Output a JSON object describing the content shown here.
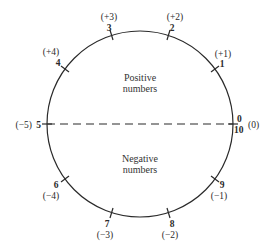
{
  "diagram": {
    "regions": {
      "positive": {
        "line1": "Positive",
        "line2": "numbers"
      },
      "negative": {
        "line1": "Negative",
        "line2": "numbers"
      }
    },
    "ticks": [
      {
        "digit": "0",
        "alt_digit": "10",
        "signed": "(0)"
      },
      {
        "digit": "1",
        "signed": "(+1)"
      },
      {
        "digit": "2",
        "signed": "(+2)"
      },
      {
        "digit": "3",
        "signed": "(+3)"
      },
      {
        "digit": "4",
        "signed": "(+4)"
      },
      {
        "digit": "5",
        "signed": "(−5)"
      },
      {
        "digit": "6",
        "signed": "(−4)"
      },
      {
        "digit": "7",
        "signed": "(−3)"
      },
      {
        "digit": "8",
        "signed": "(−2)"
      },
      {
        "digit": "9",
        "signed": "(−1)"
      }
    ],
    "colors": {
      "line": "#2a2a2a",
      "text": "#2a2a2a"
    }
  }
}
